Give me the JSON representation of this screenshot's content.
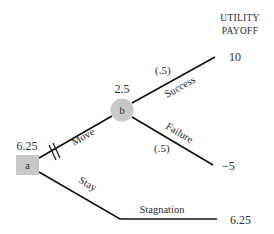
{
  "header": {
    "line1": "UTILITY",
    "line2": "PAYOFF"
  },
  "nodes": {
    "decision": {
      "id": "a",
      "value": "6.25",
      "shape": "square",
      "color": "#c8c8c8"
    },
    "chance": {
      "id": "b",
      "value": "2.5",
      "shape": "circle",
      "color": "#c8c8c8"
    }
  },
  "branches": {
    "move": {
      "label": "Move",
      "blocked": false
    },
    "stay": {
      "label": "Stay"
    },
    "success": {
      "label": "Success",
      "probability": "(.5)"
    },
    "failure": {
      "label": "Failure",
      "probability": "(.5)"
    },
    "stagnation": {
      "label": "Stagnation"
    }
  },
  "payoffs": {
    "success": "10",
    "failure": "−5",
    "stagnation": "6.25"
  }
}
